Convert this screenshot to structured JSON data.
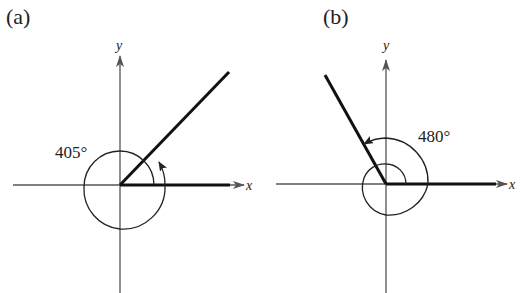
{
  "panels": [
    {
      "id": "a",
      "label": "(a)",
      "angle_label": "405°",
      "angle_degrees": 405,
      "x_axis_label": "x",
      "y_axis_label": "y"
    },
    {
      "id": "b",
      "label": "(b)",
      "angle_label": "480°",
      "angle_degrees": 480,
      "x_axis_label": "x",
      "y_axis_label": "y"
    }
  ],
  "colors": {
    "axis": "#555555",
    "ray": "#111111",
    "text": "#222222"
  }
}
